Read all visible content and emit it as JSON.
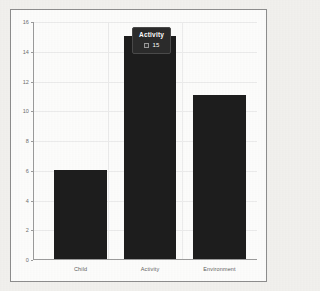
{
  "chart_data": {
    "type": "bar",
    "title": "",
    "xlabel": "",
    "ylabel": "",
    "categories": [
      "Child",
      "Activity",
      "Environment"
    ],
    "values": [
      6,
      15,
      11
    ],
    "series": [
      {
        "name": "Activity",
        "values": [
          6,
          15,
          11
        ]
      }
    ],
    "ylim": [
      0,
      16
    ],
    "ytick_values": [
      0,
      2,
      4,
      6,
      8,
      10,
      12,
      14,
      16
    ],
    "ytick_labels": [
      "0",
      "2",
      "4",
      "6",
      "8",
      "10",
      "12",
      "14",
      "16"
    ],
    "grid": true,
    "legend": "none",
    "bar_color": "#1d1d1d",
    "plot_background": "#fdfdfc",
    "frame_color": "#8d8d8d",
    "annotations": [
      {
        "kind": "tooltip",
        "attached_to": "Activity",
        "title": "Activity",
        "value": "15",
        "swatch_color": "#353535",
        "background": "#2b2b2b",
        "text_color": "#ffffff"
      }
    ]
  },
  "tooltip": {
    "title": "Activity",
    "value": "15",
    "swatch_name": "series-color-swatch"
  }
}
